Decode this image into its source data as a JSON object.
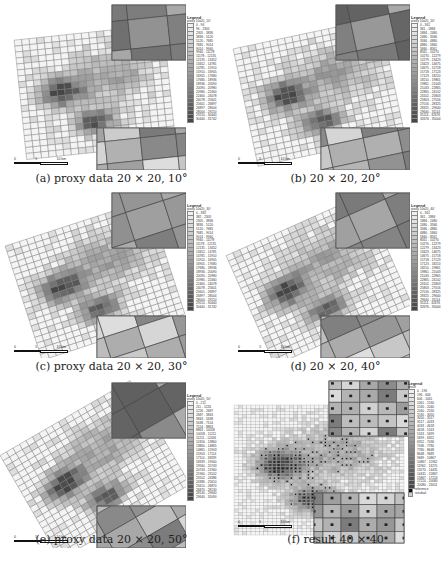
{
  "figure": {
    "panels": [
      {
        "id": "a",
        "caption": "(a) proxy data 20 × 20, 10°",
        "angle": 10,
        "grid": "20 × 20",
        "kind": "proxy data",
        "legend": {
          "title": "Legend",
          "layer": "proxy 10x20_10°",
          "entries": [
            "0 - 96",
            "96 - 2305",
            "2305 - 3836",
            "3836 - 5120",
            "5120 - 7685",
            "7685 - 9014",
            "9014 - 9940",
            "9940 - 11178",
            "11178 - 12135",
            "12135 - 13452",
            "13452 - 14781",
            "14781 - 15910",
            "15910 - 16905",
            "16905 - 17680",
            "17680 - 18936",
            "18936 - 20090",
            "20090 - 20980",
            "20980 - 22460",
            "22460 - 24078",
            "24078 - 25601",
            "25601 - 26897",
            "26897 - 28004",
            "28004 - 29210",
            "29210 - 30440",
            "30440 - 31742"
          ]
        }
      },
      {
        "id": "b",
        "caption": "(b) 20 × 20, 20°",
        "angle": 20,
        "grid": "20 × 20",
        "kind": "",
        "legend": {
          "title": "Legend",
          "layer": "proxy 10x20_20°",
          "entries": [
            "0 - 361",
            "361 - 1884",
            "1884 - 2480",
            "2480 - 3346",
            "3346 - 4880",
            "4880 - 5840",
            "5840 - 8561",
            "8561 - 10270",
            "10270 - 12279",
            "12279 - 13423",
            "13423 - 14675",
            "14675 - 15718",
            "15718 - 17123",
            "17123 - 18210",
            "18210 - 19861",
            "19861 - 21043",
            "21043 - 22865",
            "22865 - 24102",
            "24102 - 25803",
            "25803 - 27016",
            "27016 - 28325",
            "28325 - 29640",
            "29640 - 31114",
            "31114 - 32676",
            "32676 - 35004"
          ]
        }
      },
      {
        "id": "c",
        "caption": "(c) proxy data 20 × 20, 30°",
        "angle": 30,
        "grid": "20 × 20",
        "kind": "proxy data",
        "legend": {
          "title": "Legend",
          "layer": "proxy 10x20_30°",
          "entries": [
            "0 - 382",
            "382 - 2305",
            "2305 - 3836",
            "3836 - 5120",
            "5120 - 7685",
            "7685 - 9014",
            "9014 - 9940",
            "9940 - 11178",
            "11178 - 12135",
            "12135 - 13452",
            "13452 - 14781",
            "14781 - 15910",
            "15910 - 16905",
            "16905 - 17680",
            "17680 - 18936",
            "18936 - 20090",
            "20090 - 20980",
            "20980 - 22460",
            "22460 - 24078",
            "24078 - 25601",
            "25601 - 26897",
            "26897 - 28004",
            "28004 - 29210",
            "29210 - 30440",
            "30440 - 31742"
          ]
        }
      },
      {
        "id": "d",
        "caption": "(d) 20 × 20, 40°",
        "angle": 40,
        "grid": "20 × 20",
        "kind": "",
        "legend": {
          "title": "Legend",
          "layer": "proxy 10x20_40°",
          "entries": [
            "0 - 361",
            "361 - 1884",
            "1884 - 2480",
            "2480 - 3346",
            "3346 - 4880",
            "4880 - 5840",
            "5840 - 8561",
            "8561 - 10270",
            "10270 - 12279",
            "12279 - 13423",
            "13423 - 14675",
            "14675 - 15718",
            "15718 - 17123",
            "17123 - 18210",
            "18210 - 19861",
            "19861 - 21043",
            "21043 - 22865",
            "22865 - 24102",
            "24102 - 25803",
            "25803 - 27016",
            "27016 - 28325",
            "28325 - 29640",
            "29640 - 31114",
            "31114 - 32676",
            "32676 - 35004"
          ]
        }
      },
      {
        "id": "e",
        "caption": "(e) proxy data 20 × 20, 50°",
        "angle": 50,
        "grid": "20 × 20",
        "kind": "proxy data",
        "legend": {
          "title": "Legend",
          "layer": "proxy 10x20_50°",
          "entries": [
            "0 - 211",
            "211 - 1226",
            "1226 - 2687",
            "2687 - 3843",
            "3843 - 5638",
            "5638 - 7154",
            "7154 - 8863",
            "8863 - 10058",
            "10058 - 11211",
            "11211 - 12456",
            "12456 - 13860",
            "13860 - 14865",
            "14865 - 15903",
            "15903 - 17114",
            "17114 - 18339",
            "18339 - 19560",
            "19560 - 20743",
            "20743 - 21960",
            "21960 - 23102",
            "23102 - 24386",
            "24386 - 25610",
            "25610 - 26870",
            "26870 - 28130",
            "28130 - 29640",
            "29640 - 31090"
          ]
        }
      },
      {
        "id": "f",
        "caption": "(f) result 40 × 40",
        "angle": 0,
        "grid": "40 × 40",
        "kind": "result",
        "legend": {
          "title": "Legend",
          "layer": "result",
          "entries": [
            "0 - 196",
            "196 - 606",
            "606 - 1061",
            "1061 - 1530",
            "1530 - 2040",
            "2040 - 2530",
            "2530 - 3050",
            "3050 - 3517",
            "3517 - 4033",
            "4033 - 4618",
            "4618 - 5163",
            "5163 - 5699",
            "5699 - 6352",
            "6352 - 7036",
            "7036 - 7780",
            "7780 - 8648",
            "8648 - 9689",
            "9689 - 10867",
            "10867 - 11962",
            "11962 - 13270",
            "13270 - 14431",
            "14431 - 15867",
            "15867 - 17224",
            "17224 - 20080",
            "20080 - 23011"
          ],
          "markers": [
            "reference",
            "residual"
          ]
        }
      }
    ],
    "scalebar": {
      "labels": [
        "0",
        "5",
        "10 km"
      ]
    }
  }
}
